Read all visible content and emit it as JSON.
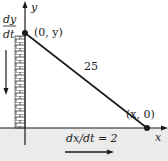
{
  "diagram": {
    "type": "ladder-related-rates",
    "axes": {
      "x_label": "x",
      "y_label": "y"
    },
    "points": {
      "top": {
        "label": "(0, y)"
      },
      "bottom": {
        "label": "(x, 0)"
      }
    },
    "ladder_length_label": "25",
    "rates": {
      "dy_numerator": "dy",
      "dy_denominator": "dt",
      "dx_label": "dx/dt = 2"
    },
    "colors": {
      "line": "#1a1a1a",
      "ground_fill": "#e9e9e9",
      "background": "#ffffff"
    }
  }
}
